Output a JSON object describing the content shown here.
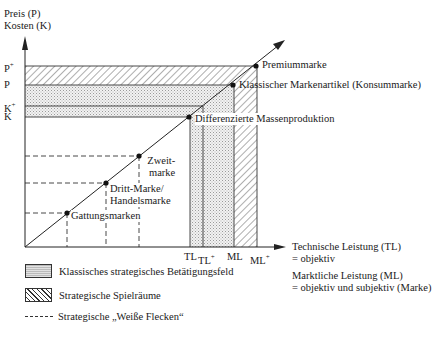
{
  "y_axis": {
    "label_line1": "Preis (P)",
    "label_line2": "Kosten (K)"
  },
  "y_ticks": [
    {
      "label": "P",
      "sup": "+"
    },
    {
      "label": "P",
      "sup": ""
    },
    {
      "label": "K",
      "sup": "+"
    },
    {
      "label": "K",
      "sup": ""
    }
  ],
  "x_ticks": [
    {
      "label": "TL",
      "sup": ""
    },
    {
      "label": "TL",
      "sup": "+"
    },
    {
      "label": "ML",
      "sup": ""
    },
    {
      "label": "ML",
      "sup": "+"
    }
  ],
  "x_axis": {
    "label_line1": "Technische Leistung (TL)",
    "label_line2": "= objektiv",
    "label_line3": "Marktliche Leistung (ML)",
    "label_line4": "= objektiv und subjektiv (Marke)"
  },
  "points": [
    {
      "label": "Premiummarke"
    },
    {
      "label": "Klassischer Markenartikel (Konsummarke)"
    },
    {
      "label": "Differenzierte Massenproduktion"
    },
    {
      "label_line1": "Zweit-",
      "label_line2": "marke"
    },
    {
      "label_line1": "Dritt-Marke/",
      "label_line2": "Handelsmarke"
    },
    {
      "label": "Gattungsmarken"
    }
  ],
  "legend": {
    "items": [
      {
        "label": "Klassisches strategisches Betätigungsfeld",
        "pattern": "dotted-fill"
      },
      {
        "label": "Strategische Spielräume",
        "pattern": "diagonal-hatch"
      },
      {
        "label": "Strategische „Weiße Flecken“",
        "pattern": "dashed-line"
      }
    ]
  }
}
